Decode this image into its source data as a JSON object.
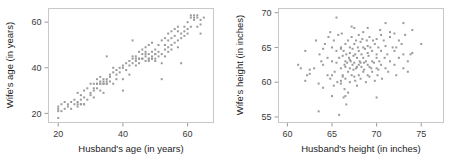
{
  "chart_data": [
    {
      "type": "scatter",
      "title": "",
      "xlabel": "Husband's age (in years)",
      "ylabel": "Wife's age (in years)",
      "xlim": [
        17,
        68
      ],
      "ylim": [
        16,
        66
      ],
      "xticks": [
        20,
        40,
        60
      ],
      "yticks": [
        20,
        40,
        60
      ],
      "grid": false,
      "legend": "none",
      "marker": {
        "shape": "square",
        "size_px": 2,
        "color": "#9b9b9b"
      },
      "points": [
        [
          20,
          18
        ],
        [
          20,
          21
        ],
        [
          20,
          22
        ],
        [
          20,
          23
        ],
        [
          21,
          21
        ],
        [
          21,
          24
        ],
        [
          22,
          22
        ],
        [
          22,
          25
        ],
        [
          23,
          24
        ],
        [
          23,
          23
        ],
        [
          24,
          25
        ],
        [
          24,
          22
        ],
        [
          25,
          26
        ],
        [
          25,
          24
        ],
        [
          26,
          25
        ],
        [
          26,
          29
        ],
        [
          26,
          23
        ],
        [
          27,
          24
        ],
        [
          27,
          28
        ],
        [
          27,
          26
        ],
        [
          28,
          24
        ],
        [
          28,
          30
        ],
        [
          28,
          27
        ],
        [
          29,
          31
        ],
        [
          29,
          26
        ],
        [
          30,
          33
        ],
        [
          30,
          28
        ],
        [
          31,
          30
        ],
        [
          31,
          33
        ],
        [
          31,
          27
        ],
        [
          32,
          33
        ],
        [
          32,
          31
        ],
        [
          32,
          35
        ],
        [
          33,
          33
        ],
        [
          33,
          34
        ],
        [
          33,
          30
        ],
        [
          33,
          36
        ],
        [
          34,
          33
        ],
        [
          34,
          34
        ],
        [
          34,
          35
        ],
        [
          34,
          29
        ],
        [
          35,
          34
        ],
        [
          35,
          35
        ],
        [
          35,
          45
        ],
        [
          35,
          33
        ],
        [
          36,
          37
        ],
        [
          36,
          34
        ],
        [
          36,
          36
        ],
        [
          37,
          33
        ],
        [
          37,
          38
        ],
        [
          37,
          40
        ],
        [
          38,
          35
        ],
        [
          38,
          39
        ],
        [
          38,
          37
        ],
        [
          39,
          38
        ],
        [
          39,
          40
        ],
        [
          40,
          30
        ],
        [
          40,
          35
        ],
        [
          40,
          40
        ],
        [
          40,
          41
        ],
        [
          41,
          39
        ],
        [
          41,
          42
        ],
        [
          42,
          37
        ],
        [
          42,
          41
        ],
        [
          42,
          43
        ],
        [
          43,
          45
        ],
        [
          43,
          52
        ],
        [
          43,
          42
        ],
        [
          43,
          44
        ],
        [
          44,
          43
        ],
        [
          44,
          41
        ],
        [
          44,
          45
        ],
        [
          45,
          42
        ],
        [
          45,
          47
        ],
        [
          45,
          44
        ],
        [
          46,
          44
        ],
        [
          46,
          46
        ],
        [
          46,
          48
        ],
        [
          47,
          43
        ],
        [
          47,
          45
        ],
        [
          47,
          49
        ],
        [
          47,
          47
        ],
        [
          48,
          44
        ],
        [
          48,
          46
        ],
        [
          48,
          50
        ],
        [
          48,
          43
        ],
        [
          49,
          45
        ],
        [
          49,
          47
        ],
        [
          49,
          44
        ],
        [
          49,
          51
        ],
        [
          50,
          44
        ],
        [
          50,
          46
        ],
        [
          50,
          48
        ],
        [
          50,
          43
        ],
        [
          51,
          45
        ],
        [
          51,
          50
        ],
        [
          51,
          47
        ],
        [
          52,
          46
        ],
        [
          52,
          52
        ],
        [
          52,
          42
        ],
        [
          52,
          35
        ],
        [
          53,
          48
        ],
        [
          53,
          53
        ],
        [
          53,
          45
        ],
        [
          53,
          50
        ],
        [
          54,
          52
        ],
        [
          54,
          49
        ],
        [
          54,
          55
        ],
        [
          54,
          47
        ],
        [
          55,
          53
        ],
        [
          55,
          50
        ],
        [
          55,
          56
        ],
        [
          55,
          48
        ],
        [
          56,
          54
        ],
        [
          56,
          51
        ],
        [
          56,
          57
        ],
        [
          57,
          52
        ],
        [
          57,
          56
        ],
        [
          57,
          49
        ],
        [
          57,
          58
        ],
        [
          58,
          55
        ],
        [
          58,
          53
        ],
        [
          58,
          42
        ],
        [
          59,
          56
        ],
        [
          59,
          58
        ],
        [
          59,
          54
        ],
        [
          60,
          57
        ],
        [
          60,
          60
        ],
        [
          60,
          55
        ],
        [
          61,
          62
        ],
        [
          61,
          63
        ],
        [
          61,
          58
        ],
        [
          62,
          63
        ],
        [
          62,
          62
        ],
        [
          62,
          61
        ],
        [
          63,
          63
        ],
        [
          63,
          62
        ],
        [
          63,
          58
        ],
        [
          64,
          61
        ],
        [
          64,
          55
        ],
        [
          64,
          59
        ],
        [
          65,
          62
        ],
        [
          35,
          33
        ],
        [
          34,
          33
        ],
        [
          33,
          33
        ],
        [
          32,
          33
        ],
        [
          27,
          24
        ],
        [
          28,
          24
        ],
        [
          26,
          24
        ],
        [
          30,
          29
        ],
        [
          31,
          31
        ],
        [
          44,
          44
        ],
        [
          45,
          44
        ],
        [
          46,
          44
        ],
        [
          48,
          44
        ],
        [
          49,
          44
        ],
        [
          47,
          46
        ],
        [
          50,
          46
        ]
      ]
    },
    {
      "type": "scatter",
      "title": "",
      "xlabel": "Husband's height (in inches)",
      "ylabel": "Wife's height (in inches)",
      "xlim": [
        59,
        77.5
      ],
      "ylim": [
        54.2,
        70.6
      ],
      "xticks": [
        60,
        65,
        70,
        75
      ],
      "yticks": [
        55,
        60,
        65,
        70
      ],
      "grid": false,
      "legend": "none",
      "marker": {
        "shape": "square",
        "size_px": 2,
        "color": "#9b9b9b"
      },
      "points": [
        [
          61.5,
          62.0
        ],
        [
          62.0,
          64.5
        ],
        [
          62.0,
          60.2
        ],
        [
          62.2,
          61.0
        ],
        [
          62.5,
          61.8
        ],
        [
          63.0,
          62.0
        ],
        [
          63.5,
          59.8
        ],
        [
          63.5,
          55.8
        ],
        [
          63.6,
          64.0
        ],
        [
          63.8,
          63.0
        ],
        [
          64.0,
          64.8
        ],
        [
          64.0,
          62.5
        ],
        [
          64.2,
          65.5
        ],
        [
          64.5,
          63.5
        ],
        [
          64.5,
          61.0
        ],
        [
          64.6,
          66.5
        ],
        [
          64.8,
          60.5
        ],
        [
          65.0,
          65.0
        ],
        [
          65.0,
          63.0
        ],
        [
          65.2,
          66.0
        ],
        [
          65.3,
          61.5
        ],
        [
          65.5,
          69.3
        ],
        [
          65.5,
          64.5
        ],
        [
          65.5,
          62.8
        ],
        [
          65.6,
          60.0
        ],
        [
          65.7,
          66.8
        ],
        [
          65.8,
          63.5
        ],
        [
          65.8,
          55.3
        ],
        [
          66.0,
          65.0
        ],
        [
          66.0,
          62.0
        ],
        [
          66.0,
          60.2
        ],
        [
          66.1,
          67.0
        ],
        [
          66.2,
          63.8
        ],
        [
          66.2,
          61.0
        ],
        [
          66.3,
          64.5
        ],
        [
          66.4,
          59.0
        ],
        [
          66.4,
          62.5
        ],
        [
          66.5,
          65.5
        ],
        [
          66.5,
          63.0
        ],
        [
          66.5,
          60.5
        ],
        [
          66.6,
          64.0
        ],
        [
          66.6,
          56.8
        ],
        [
          66.7,
          62.8
        ],
        [
          66.8,
          66.0
        ],
        [
          66.8,
          61.5
        ],
        [
          66.9,
          63.5
        ],
        [
          67.0,
          65.0
        ],
        [
          67.0,
          62.0
        ],
        [
          67.0,
          64.2
        ],
        [
          67.0,
          60.0
        ],
        [
          67.1,
          63.0
        ],
        [
          67.2,
          66.5
        ],
        [
          67.2,
          61.0
        ],
        [
          67.3,
          64.8
        ],
        [
          67.3,
          62.5
        ],
        [
          67.4,
          63.8
        ],
        [
          67.5,
          65.5
        ],
        [
          67.5,
          60.8
        ],
        [
          67.5,
          62.8
        ],
        [
          67.6,
          64.0
        ],
        [
          67.7,
          66.0
        ],
        [
          67.7,
          62.0
        ],
        [
          67.8,
          63.5
        ],
        [
          67.8,
          59.5
        ],
        [
          67.9,
          65.0
        ],
        [
          68.0,
          62.5
        ],
        [
          68.0,
          64.5
        ],
        [
          68.0,
          61.0
        ],
        [
          68.0,
          66.8
        ],
        [
          68.1,
          63.0
        ],
        [
          68.2,
          65.8
        ],
        [
          68.2,
          60.5
        ],
        [
          68.3,
          64.0
        ],
        [
          68.3,
          62.2
        ],
        [
          68.4,
          66.2
        ],
        [
          68.5,
          63.5
        ],
        [
          68.5,
          61.5
        ],
        [
          68.5,
          65.0
        ],
        [
          68.6,
          62.8
        ],
        [
          68.7,
          64.8
        ],
        [
          68.8,
          60.0
        ],
        [
          68.8,
          63.0
        ],
        [
          68.9,
          66.0
        ],
        [
          69.0,
          65.2
        ],
        [
          69.0,
          62.5
        ],
        [
          69.0,
          64.2
        ],
        [
          69.0,
          61.0
        ],
        [
          69.1,
          63.8
        ],
        [
          69.2,
          66.5
        ],
        [
          69.2,
          60.8
        ],
        [
          69.3,
          65.0
        ],
        [
          69.4,
          62.0
        ],
        [
          69.5,
          64.5
        ],
        [
          69.5,
          63.0
        ],
        [
          69.5,
          61.5
        ],
        [
          69.6,
          66.0
        ],
        [
          69.7,
          62.8
        ],
        [
          69.8,
          65.5
        ],
        [
          69.8,
          60.2
        ],
        [
          70.0,
          64.0
        ],
        [
          70.0,
          62.0
        ],
        [
          70.0,
          66.2
        ],
        [
          70.0,
          63.5
        ],
        [
          70.1,
          61.0
        ],
        [
          70.2,
          65.0
        ],
        [
          70.3,
          63.0
        ],
        [
          70.4,
          67.5
        ],
        [
          70.5,
          64.5
        ],
        [
          70.5,
          62.5
        ],
        [
          70.6,
          60.5
        ],
        [
          70.8,
          66.0
        ],
        [
          70.9,
          63.5
        ],
        [
          71.0,
          68.5
        ],
        [
          71.0,
          65.2
        ],
        [
          71.0,
          62.0
        ],
        [
          71.2,
          64.0
        ],
        [
          71.3,
          61.5
        ],
        [
          71.5,
          66.5
        ],
        [
          71.5,
          63.0
        ],
        [
          71.8,
          65.0
        ],
        [
          72.0,
          67.0
        ],
        [
          72.0,
          62.5
        ],
        [
          72.0,
          64.5
        ],
        [
          72.2,
          61.0
        ],
        [
          72.5,
          66.0
        ],
        [
          72.5,
          63.5
        ],
        [
          72.8,
          65.5
        ],
        [
          73.0,
          68.5
        ],
        [
          73.0,
          62.0
        ],
        [
          73.0,
          64.0
        ],
        [
          73.2,
          66.8
        ],
        [
          73.5,
          63.0
        ],
        [
          73.5,
          61.5
        ],
        [
          74.0,
          67.5
        ],
        [
          74.0,
          64.2
        ],
        [
          75.0,
          65.5
        ],
        [
          66.3,
          57.8
        ],
        [
          70.0,
          57.8
        ],
        [
          64.8,
          67.2
        ],
        [
          67.2,
          68.0
        ],
        [
          65.0,
          58.0
        ],
        [
          66.8,
          58.5
        ],
        [
          63.2,
          66.0
        ],
        [
          65.2,
          59.5
        ],
        [
          67.5,
          67.8
        ],
        [
          69.0,
          67.8
        ],
        [
          68.5,
          67.2
        ],
        [
          71.5,
          67.2
        ],
        [
          66.0,
          64.8
        ],
        [
          67.0,
          63.2
        ],
        [
          67.8,
          62.2
        ],
        [
          68.2,
          62.8
        ],
        [
          66.5,
          62.2
        ],
        [
          67.4,
          61.8
        ],
        [
          66.2,
          60.8
        ],
        [
          66.0,
          59.8
        ],
        [
          67.6,
          60.2
        ],
        [
          68.6,
          61.8
        ],
        [
          69.2,
          62.2
        ],
        [
          70.2,
          61.8
        ],
        [
          66.5,
          58.0
        ],
        [
          61.2,
          62.5
        ],
        [
          62.5,
          61.2
        ],
        [
          64.0,
          59.2
        ],
        [
          65.0,
          61.0
        ],
        [
          73.8,
          64.0
        ],
        [
          72.2,
          65.0
        ],
        [
          70.5,
          66.8
        ]
      ]
    }
  ],
  "panels": {
    "left": {
      "name": "husband-wife-age-scatter",
      "xlabel": "Husband's age (in years)",
      "ylabel": "Wife's age (in years)",
      "xticks": [
        "20",
        "40",
        "60"
      ],
      "yticks": [
        "20",
        "40",
        "60"
      ]
    },
    "right": {
      "name": "husband-wife-height-scatter",
      "xlabel": "Husband's height (in inches)",
      "ylabel": "Wife's height (in inches)",
      "xticks": [
        "60",
        "65",
        "70",
        "75"
      ],
      "yticks": [
        "55",
        "60",
        "65",
        "70"
      ]
    }
  },
  "colors": {
    "marker": "#9b9b9b",
    "frame": "#c8c8c8",
    "tick": "#9a9a9a",
    "text": "#1c1c1c",
    "background": "#ffffff"
  }
}
